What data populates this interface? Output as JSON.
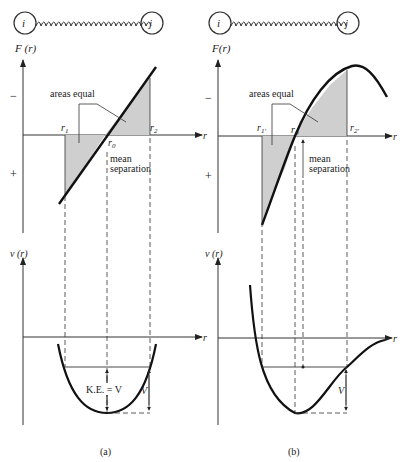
{
  "panels": [
    {
      "id": "a",
      "caption": "(a)",
      "spring": {
        "left_atom": "i",
        "right_atom": "j"
      },
      "force_plot": {
        "ylabel": "F (r)",
        "xlabel": "r",
        "minus_sign": "−",
        "plus_sign": "+",
        "r1": "r",
        "r1_sub": "1",
        "r2": "r",
        "r2_sub": "2",
        "r0": "r",
        "r0_sub": "0",
        "areas_label": "areas equal",
        "mean_label_1": "mean",
        "mean_label_2": "separation"
      },
      "potential_plot": {
        "ylabel": "ν (r)",
        "xlabel": "r",
        "ke_label": "K.E. = V",
        "v_label": "V"
      }
    },
    {
      "id": "b",
      "caption": "(b)",
      "spring": {
        "left_atom": "i",
        "right_atom": "j"
      },
      "force_plot": {
        "ylabel": "F(r)",
        "xlabel": "r",
        "minus_sign": "−",
        "plus_sign": "+",
        "r1": "r",
        "r1_sub": "1′",
        "r2": "r",
        "r2_sub": "2′",
        "r0": "r",
        "r0_sub": "0",
        "areas_label": "areas equal",
        "mean_label_1": "mean",
        "mean_label_2": "separation"
      },
      "potential_plot": {
        "ylabel": "ν (r)",
        "xlabel": "r",
        "v_label": "V"
      }
    }
  ]
}
